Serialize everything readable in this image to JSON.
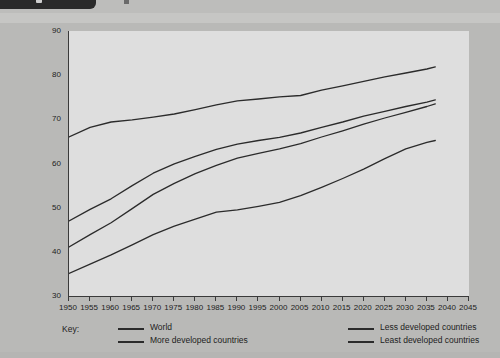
{
  "document": {
    "background_color": "#b9b9b7",
    "plot_background_color": "#dedede",
    "line_color": "#2b2b2b",
    "header_strip_note": "cut-off-dark-tab"
  },
  "axes": {
    "y": {
      "label": "Age in years",
      "ticks": [
        "30",
        "40",
        "50",
        "60",
        "70",
        "80",
        "90"
      ],
      "min": 30,
      "max": 90,
      "step": 10
    },
    "x": {
      "label": "",
      "ticks": [
        "1950",
        "1955",
        "1960",
        "1965",
        "1970",
        "1975",
        "1980",
        "1985",
        "1990",
        "1995",
        "2000",
        "2005",
        "2010",
        "2015",
        "2020",
        "2025",
        "2030",
        "2035",
        "2040",
        "2045"
      ],
      "min": 1950,
      "max": 2045,
      "step": 5
    }
  },
  "legend": {
    "title": "Key:",
    "entries": [
      {
        "label": "World",
        "column": 0,
        "row": 0
      },
      {
        "label": "More developed countries",
        "column": 0,
        "row": 1
      },
      {
        "label": "Less developed countries",
        "column": 1,
        "row": 0
      },
      {
        "label": "Least developed countries",
        "column": 1,
        "row": 1
      }
    ]
  },
  "chart_data": {
    "type": "line",
    "title": "",
    "xlabel": "",
    "ylabel": "Age in years",
    "xlim": [
      1950,
      2045
    ],
    "ylim": [
      30,
      90
    ],
    "grid": false,
    "legend_position": "bottom",
    "x": [
      1950,
      1955,
      1960,
      1965,
      1970,
      1975,
      1980,
      1985,
      1990,
      1995,
      2000,
      2005,
      2010,
      2015,
      2020,
      2025,
      2030,
      2035,
      2037
    ],
    "series": [
      {
        "name": "More developed countries",
        "values": [
          66.0,
          68.2,
          69.4,
          69.9,
          70.5,
          71.2,
          72.2,
          73.3,
          74.2,
          74.6,
          75.1,
          75.4,
          76.6,
          77.6,
          78.6,
          79.6,
          80.5,
          81.4,
          81.9
        ]
      },
      {
        "name": "World",
        "values": [
          47.0,
          49.6,
          52.0,
          55.0,
          57.8,
          59.9,
          61.6,
          63.2,
          64.4,
          65.2,
          65.9,
          66.9,
          68.2,
          69.4,
          70.7,
          71.8,
          72.9,
          73.9,
          74.4
        ]
      },
      {
        "name": "Less developed countries",
        "values": [
          41.1,
          43.9,
          46.6,
          49.8,
          53.0,
          55.5,
          57.7,
          59.6,
          61.2,
          62.3,
          63.3,
          64.5,
          66.0,
          67.4,
          68.9,
          70.3,
          71.6,
          72.9,
          73.5
        ]
      },
      {
        "name": "Least developed countries",
        "values": [
          35.1,
          37.2,
          39.3,
          41.6,
          43.9,
          45.8,
          47.4,
          49.0,
          49.5,
          50.3,
          51.2,
          52.7,
          54.6,
          56.6,
          58.7,
          61.1,
          63.3,
          64.8,
          65.2
        ]
      }
    ]
  }
}
